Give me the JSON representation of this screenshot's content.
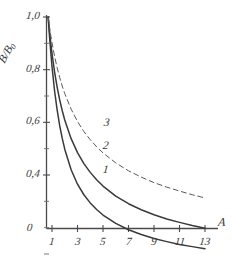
{
  "chart_data": {
    "type": "line",
    "title": "",
    "xlabel": "A",
    "ylabel": "B/B0",
    "ylabel_display": "B/B",
    "ylabel_subscript": "0",
    "xlim": [
      0,
      13.8
    ],
    "ylim": [
      0,
      1.05
    ],
    "grid": false,
    "legend": "inline-curve-numbers",
    "x_ticks": [
      {
        "value": 1,
        "label": "1"
      },
      {
        "value": 3,
        "label": "3"
      },
      {
        "value": 5,
        "label": "5"
      },
      {
        "value": 7,
        "label": "7"
      },
      {
        "value": 9,
        "label": "9"
      },
      {
        "value": 11,
        "label": "11"
      },
      {
        "value": 13,
        "label": "13"
      }
    ],
    "y_ticks": [
      {
        "value": 1.0,
        "label": "1,0"
      },
      {
        "value": 0.8,
        "label": "0,8"
      },
      {
        "value": 0.6,
        "label": "0,6"
      },
      {
        "value": 0.4,
        "label": "0,4"
      }
    ],
    "origin_label": "0",
    "series": [
      {
        "name": "1",
        "label": "1",
        "style": "solid",
        "color": "#3a3a3a",
        "label_x": 5.0,
        "label_y": 0.415,
        "x": [
          0.7,
          0.8,
          0.9,
          1.0,
          1.2,
          1.4,
          1.6,
          1.8,
          2.0,
          2.5,
          3.0,
          3.5,
          4.0,
          4.5,
          5.0,
          6.0,
          7.0,
          8.0,
          9.0,
          10.0,
          11.0,
          12.0,
          13.0
        ],
        "y": [
          1.0,
          0.93,
          0.868,
          0.812,
          0.72,
          0.648,
          0.588,
          0.54,
          0.498,
          0.42,
          0.365,
          0.325,
          0.294,
          0.269,
          0.248,
          0.216,
          0.192,
          0.174,
          0.159,
          0.147,
          0.136,
          0.128,
          0.12
        ]
      },
      {
        "name": "2",
        "label": "2",
        "style": "solid",
        "color": "#3a3a3a",
        "label_x": 5.0,
        "label_y": 0.505,
        "x": [
          0.7,
          0.8,
          0.9,
          1.0,
          1.2,
          1.4,
          1.6,
          1.8,
          2.0,
          2.5,
          3.0,
          3.5,
          4.0,
          4.5,
          5.0,
          6.0,
          7.0,
          8.0,
          9.0,
          10.0,
          11.0,
          12.0,
          13.0
        ],
        "y": [
          1.0,
          0.948,
          0.902,
          0.862,
          0.792,
          0.735,
          0.686,
          0.645,
          0.609,
          0.538,
          0.485,
          0.443,
          0.41,
          0.382,
          0.358,
          0.32,
          0.291,
          0.268,
          0.249,
          0.233,
          0.22,
          0.208,
          0.198
        ]
      },
      {
        "name": "3",
        "label": "3",
        "style": "dashed",
        "color": "#5a5a5a",
        "label_x": 5.1,
        "label_y": 0.592,
        "x": [
          0.7,
          0.8,
          0.9,
          1.0,
          1.2,
          1.4,
          1.6,
          1.8,
          2.0,
          2.5,
          3.0,
          3.5,
          4.0,
          4.5,
          5.0,
          6.0,
          7.0,
          8.0,
          9.0,
          10.0,
          11.0,
          12.0,
          13.0
        ],
        "y": [
          1.0,
          0.964,
          0.931,
          0.902,
          0.851,
          0.808,
          0.771,
          0.738,
          0.709,
          0.65,
          0.603,
          0.565,
          0.534,
          0.507,
          0.484,
          0.446,
          0.416,
          0.392,
          0.371,
          0.354,
          0.339,
          0.325,
          0.313
        ]
      }
    ]
  }
}
